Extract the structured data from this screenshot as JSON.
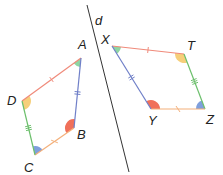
{
  "figure": {
    "axis_line": {
      "label": "d",
      "color": "#333333"
    },
    "quadrilateral_left": {
      "name": "ABCD",
      "vertices": [
        {
          "id": "A",
          "label": "A",
          "angle_color": "#8fd6a3"
        },
        {
          "id": "B",
          "label": "B",
          "angle_color": "#f0705a"
        },
        {
          "id": "C",
          "label": "C",
          "angle_color": "#7f9fdc"
        },
        {
          "id": "D",
          "label": "D",
          "angle_color": "#f6cf7a"
        }
      ],
      "sides": [
        {
          "from": "D",
          "to": "A",
          "color": "#f08a7a",
          "tick": "single"
        },
        {
          "from": "A",
          "to": "B",
          "color": "#6f7fc8",
          "tick": "double"
        },
        {
          "from": "B",
          "to": "C",
          "color": "#f4b07a",
          "tick": "cross"
        },
        {
          "from": "C",
          "to": "D",
          "color": "#6cbf6c",
          "tick": "triple"
        }
      ]
    },
    "quadrilateral_right": {
      "name": "XTZY",
      "vertices": [
        {
          "id": "X",
          "label": "X",
          "angle_color": "#8fd6a3"
        },
        {
          "id": "T",
          "label": "T",
          "angle_color": "#f6cf7a"
        },
        {
          "id": "Z",
          "label": "Z",
          "angle_color": "#7f9fdc"
        },
        {
          "id": "Y",
          "label": "Y",
          "angle_color": "#f0705a"
        }
      ],
      "sides": [
        {
          "from": "X",
          "to": "T",
          "color": "#f08a7a",
          "tick": "single"
        },
        {
          "from": "T",
          "to": "Z",
          "color": "#6cbf6c",
          "tick": "triple"
        },
        {
          "from": "Z",
          "to": "Y",
          "color": "#f4b07a",
          "tick": "cross"
        },
        {
          "from": "Y",
          "to": "X",
          "color": "#6f7fc8",
          "tick": "double"
        }
      ]
    }
  }
}
